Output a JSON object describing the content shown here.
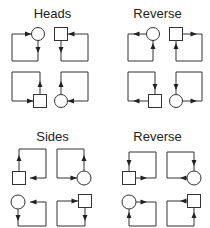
{
  "panels": [
    {
      "id": "heads",
      "title": "Heads",
      "position": "top-left"
    },
    {
      "id": "heads-reverse",
      "title": "Reverse",
      "position": "top-right"
    },
    {
      "id": "sides",
      "title": "Sides",
      "position": "bottom-left"
    },
    {
      "id": "sides-reverse",
      "title": "Reverse",
      "position": "bottom-right"
    }
  ],
  "legend": {
    "shapes": [
      "circle",
      "square"
    ],
    "description": "Each panel shows four loop arrangements linking a circle or square node with a directed rectangular arrow path."
  },
  "colors": {
    "stroke": "#333333",
    "background": "#ffffff"
  }
}
